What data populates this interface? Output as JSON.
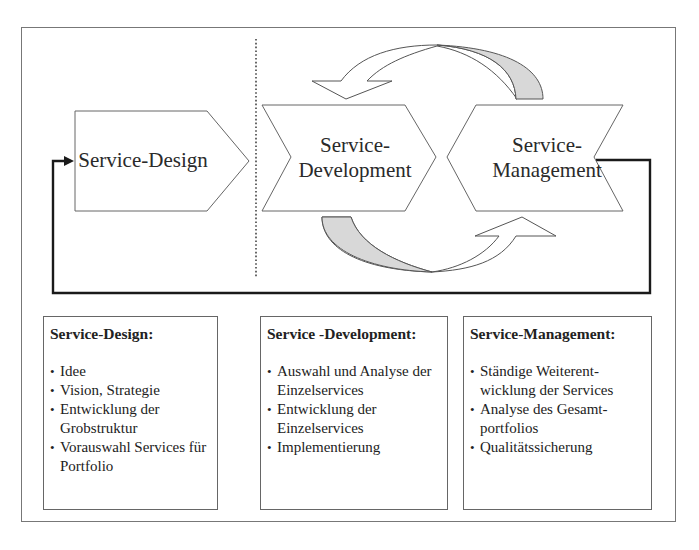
{
  "diagram": {
    "phases": [
      {
        "id": "design",
        "label_lines": [
          "Service-Design"
        ]
      },
      {
        "id": "development",
        "label_lines": [
          "Service-",
          "Development"
        ]
      },
      {
        "id": "management",
        "label_lines": [
          "Service-",
          "Management"
        ]
      }
    ],
    "colors": {
      "outline": "#555555",
      "feedback_line": "#1a1a1a",
      "cycle_arrow_shade": "#d8d8d8",
      "divider": "#444444"
    }
  },
  "boxes": [
    {
      "title": "Service-Design:",
      "items": [
        "Idee",
        "Vision, Strategie",
        "Entwicklung der Grobstruktur",
        "Vorauswahl Services für Portfolio"
      ]
    },
    {
      "title": "Service -Development:",
      "items": [
        "Auswahl und Analyse der Einzelservices",
        "Entwicklung der Einzelservices",
        "Implementierung"
      ]
    },
    {
      "title": "Service-Management:",
      "items": [
        "Ständige Weiterent- wicklung der Services",
        "Analyse des Gesamt- portfolios",
        "Qualitätssicherung"
      ]
    }
  ]
}
